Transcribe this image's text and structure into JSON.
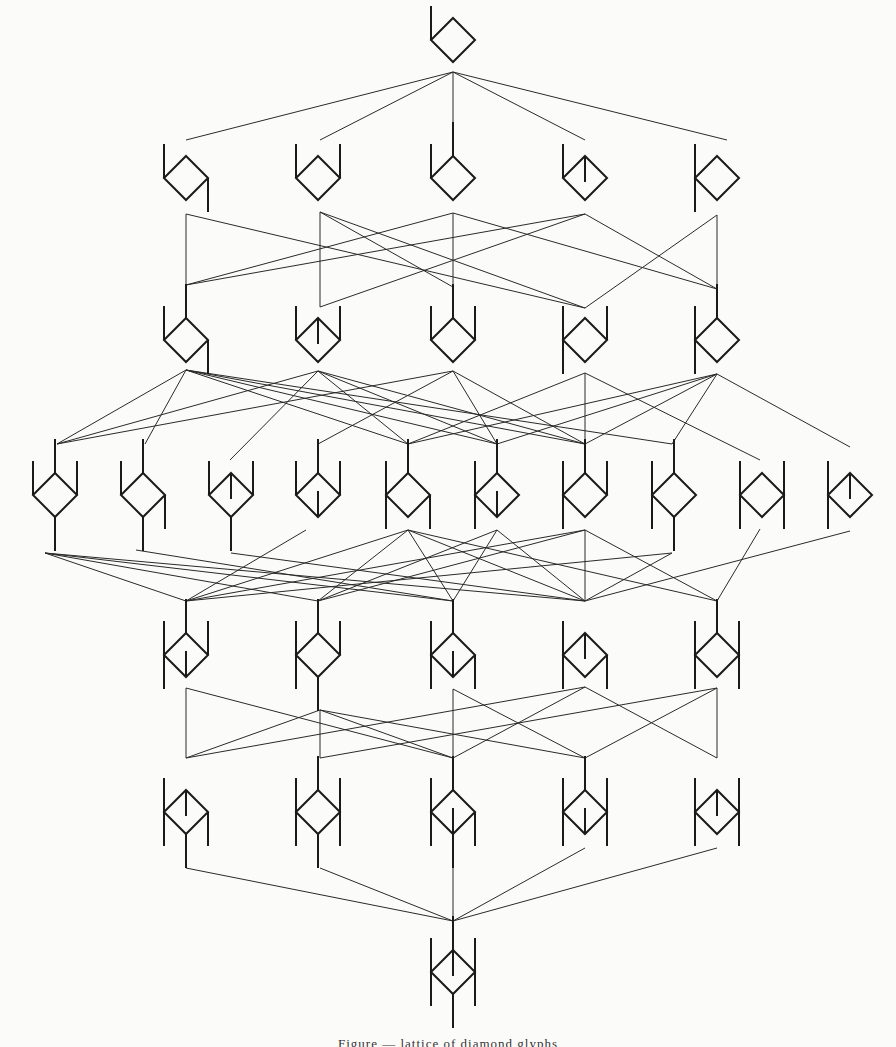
{
  "diagram": {
    "title": "Lattice of diamond glyphs",
    "colors": {
      "ink": "#1a1a1a",
      "edge": "#2a2a2a",
      "paper": "#fbfbfa"
    },
    "glyph_size": 22,
    "stub_len": 34,
    "stub_legend": {
      "LU": "left vertex stub going up",
      "LD": "left vertex stub going down",
      "RU": "right vertex stub going up",
      "RD": "right vertex stub going down",
      "TU": "top vertex stub going up",
      "BD": "bottom vertex stub going down",
      "IN": "inner stub from top vertex going down into diamond",
      "IB": "inner stub from bottom vertex going up into diamond"
    },
    "rows": [
      {
        "y": 40,
        "nodes": [
          {
            "id": "n0",
            "x": 453,
            "stubs": [
              "LU"
            ]
          }
        ]
      },
      {
        "y": 178,
        "nodes": [
          {
            "id": "r1a",
            "x": 186,
            "stubs": [
              "LU",
              "RD"
            ]
          },
          {
            "id": "r1b",
            "x": 318,
            "stubs": [
              "LU",
              "RU"
            ]
          },
          {
            "id": "r1c",
            "x": 453,
            "stubs": [
              "LU",
              "TU"
            ]
          },
          {
            "id": "r1d",
            "x": 585,
            "stubs": [
              "LU",
              "IN"
            ]
          },
          {
            "id": "r1e",
            "x": 717,
            "stubs": [
              "LU",
              "LD"
            ]
          }
        ]
      },
      {
        "y": 340,
        "nodes": [
          {
            "id": "r2a",
            "x": 186,
            "stubs": [
              "LU",
              "TU",
              "RD"
            ]
          },
          {
            "id": "r2b",
            "x": 318,
            "stubs": [
              "LU",
              "IN",
              "RU"
            ]
          },
          {
            "id": "r2c",
            "x": 453,
            "stubs": [
              "LU",
              "TU",
              "RU"
            ]
          },
          {
            "id": "r2d",
            "x": 585,
            "stubs": [
              "LU",
              "LD",
              "RU"
            ]
          },
          {
            "id": "r2e",
            "x": 717,
            "stubs": [
              "LU",
              "LD",
              "TU"
            ]
          }
        ]
      },
      {
        "y": 495,
        "nodes": [
          {
            "id": "r3a",
            "x": 55,
            "stubs": [
              "LU",
              "TU",
              "RU",
              "BD"
            ]
          },
          {
            "id": "r3b",
            "x": 143,
            "stubs": [
              "LU",
              "TU",
              "RD",
              "BD"
            ]
          },
          {
            "id": "r3c",
            "x": 231,
            "stubs": [
              "LU",
              "IN",
              "RU",
              "BD"
            ]
          },
          {
            "id": "r3d",
            "x": 318,
            "stubs": [
              "LU",
              "TU",
              "RU",
              "IB"
            ]
          },
          {
            "id": "r3e",
            "x": 408,
            "stubs": [
              "LU",
              "LD",
              "TU",
              "RD"
            ]
          },
          {
            "id": "r3f",
            "x": 497,
            "stubs": [
              "LU",
              "LD",
              "TU",
              "IB"
            ]
          },
          {
            "id": "r3g",
            "x": 585,
            "stubs": [
              "LU",
              "LD",
              "TU",
              "RU"
            ]
          },
          {
            "id": "r3h",
            "x": 674,
            "stubs": [
              "LU",
              "LD",
              "TU",
              "BD"
            ]
          },
          {
            "id": "r3i",
            "x": 762,
            "stubs": [
              "LU",
              "LD",
              "RU",
              "RD"
            ]
          },
          {
            "id": "r3j",
            "x": 850,
            "stubs": [
              "LU",
              "LD",
              "IN"
            ]
          }
        ]
      },
      {
        "y": 655,
        "nodes": [
          {
            "id": "r4a",
            "x": 186,
            "stubs": [
              "LU",
              "LD",
              "TU",
              "RU",
              "IB"
            ]
          },
          {
            "id": "r4b",
            "x": 318,
            "stubs": [
              "LU",
              "LD",
              "TU",
              "RU",
              "BD"
            ]
          },
          {
            "id": "r4c",
            "x": 453,
            "stubs": [
              "LU",
              "LD",
              "TU",
              "RD",
              "IB"
            ]
          },
          {
            "id": "r4d",
            "x": 585,
            "stubs": [
              "LU",
              "LD",
              "IN",
              "RD"
            ]
          },
          {
            "id": "r4e",
            "x": 717,
            "stubs": [
              "LU",
              "LD",
              "TU",
              "RU",
              "RD"
            ]
          }
        ]
      },
      {
        "y": 812,
        "nodes": [
          {
            "id": "r5a",
            "x": 186,
            "stubs": [
              "LU",
              "LD",
              "IN",
              "RD",
              "BD"
            ]
          },
          {
            "id": "r5b",
            "x": 318,
            "stubs": [
              "LU",
              "LD",
              "TU",
              "RU",
              "RD",
              "BD"
            ]
          },
          {
            "id": "r5c",
            "x": 453,
            "stubs": [
              "LU",
              "LD",
              "TU",
              "RD",
              "IB",
              "BD"
            ]
          },
          {
            "id": "r5d",
            "x": 585,
            "stubs": [
              "LU",
              "LD",
              "TU",
              "RU",
              "RD",
              "IB"
            ]
          },
          {
            "id": "r5e",
            "x": 717,
            "stubs": [
              "LU",
              "LD",
              "IN",
              "RU",
              "RD"
            ]
          }
        ]
      },
      {
        "y": 972,
        "nodes": [
          {
            "id": "n6",
            "x": 453,
            "stubs": [
              "LU",
              "LD",
              "TU",
              "RU",
              "RD",
              "IN",
              "BD"
            ]
          }
        ]
      }
    ],
    "edges": [
      {
        "from": [
          453,
          72
        ],
        "to": [
          186,
          140
        ]
      },
      {
        "from": [
          453,
          72
        ],
        "to": [
          320,
          140
        ]
      },
      {
        "from": [
          453,
          72
        ],
        "to": [
          453,
          140
        ]
      },
      {
        "from": [
          453,
          72
        ],
        "to": [
          585,
          140
        ]
      },
      {
        "from": [
          453,
          72
        ],
        "to": [
          727,
          140
        ]
      },
      {
        "from": [
          186,
          214
        ],
        "to": [
          186,
          285
        ]
      },
      {
        "from": [
          186,
          214
        ],
        "to": [
          585,
          308
        ]
      },
      {
        "from": [
          320,
          212
        ],
        "to": [
          320,
          307
        ]
      },
      {
        "from": [
          320,
          212
        ],
        "to": [
          453,
          287
        ]
      },
      {
        "from": [
          320,
          212
        ],
        "to": [
          585,
          308
        ]
      },
      {
        "from": [
          453,
          213
        ],
        "to": [
          186,
          285
        ]
      },
      {
        "from": [
          453,
          213
        ],
        "to": [
          453,
          287
        ]
      },
      {
        "from": [
          453,
          213
        ],
        "to": [
          717,
          289
        ]
      },
      {
        "from": [
          585,
          214
        ],
        "to": [
          186,
          285
        ]
      },
      {
        "from": [
          585,
          214
        ],
        "to": [
          320,
          307
        ]
      },
      {
        "from": [
          585,
          214
        ],
        "to": [
          717,
          289
        ]
      },
      {
        "from": [
          717,
          215
        ],
        "to": [
          585,
          308
        ]
      },
      {
        "from": [
          717,
          215
        ],
        "to": [
          717,
          289
        ]
      },
      {
        "from": [
          186,
          370
        ],
        "to": [
          57,
          444
        ]
      },
      {
        "from": [
          186,
          370
        ],
        "to": [
          145,
          444
        ]
      },
      {
        "from": [
          186,
          370
        ],
        "to": [
          408,
          444
        ]
      },
      {
        "from": [
          186,
          370
        ],
        "to": [
          585,
          444
        ]
      },
      {
        "from": [
          186,
          370
        ],
        "to": [
          497,
          444
        ]
      },
      {
        "from": [
          186,
          370
        ],
        "to": [
          672,
          444
        ]
      },
      {
        "from": [
          318,
          371
        ],
        "to": [
          57,
          444
        ]
      },
      {
        "from": [
          318,
          371
        ],
        "to": [
          230,
          460
        ]
      },
      {
        "from": [
          318,
          371
        ],
        "to": [
          408,
          444
        ]
      },
      {
        "from": [
          318,
          371
        ],
        "to": [
          497,
          444
        ]
      },
      {
        "from": [
          318,
          371
        ],
        "to": [
          585,
          444
        ]
      },
      {
        "from": [
          453,
          371
        ],
        "to": [
          57,
          444
        ]
      },
      {
        "from": [
          453,
          371
        ],
        "to": [
          318,
          444
        ]
      },
      {
        "from": [
          453,
          371
        ],
        "to": [
          497,
          444
        ]
      },
      {
        "from": [
          453,
          371
        ],
        "to": [
          585,
          444
        ]
      },
      {
        "from": [
          585,
          373
        ],
        "to": [
          408,
          444
        ]
      },
      {
        "from": [
          585,
          373
        ],
        "to": [
          585,
          444
        ]
      },
      {
        "from": [
          585,
          373
        ],
        "to": [
          760,
          460
        ]
      },
      {
        "from": [
          717,
          374
        ],
        "to": [
          408,
          444
        ]
      },
      {
        "from": [
          717,
          374
        ],
        "to": [
          497,
          444
        ]
      },
      {
        "from": [
          717,
          374
        ],
        "to": [
          585,
          444
        ]
      },
      {
        "from": [
          717,
          374
        ],
        "to": [
          672,
          444
        ]
      },
      {
        "from": [
          717,
          374
        ],
        "to": [
          850,
          447
        ]
      },
      {
        "from": [
          45,
          553
        ],
        "to": [
          186,
          601
        ]
      },
      {
        "from": [
          45,
          553
        ],
        "to": [
          318,
          601
        ]
      },
      {
        "from": [
          45,
          553
        ],
        "to": [
          453,
          601
        ]
      },
      {
        "from": [
          45,
          553
        ],
        "to": [
          585,
          601
        ]
      },
      {
        "from": [
          136,
          550
        ],
        "to": [
          453,
          601
        ]
      },
      {
        "from": [
          231,
          553
        ],
        "to": [
          585,
          601
        ]
      },
      {
        "from": [
          306,
          530
        ],
        "to": [
          186,
          601
        ]
      },
      {
        "from": [
          408,
          530
        ],
        "to": [
          186,
          601
        ]
      },
      {
        "from": [
          408,
          530
        ],
        "to": [
          318,
          601
        ]
      },
      {
        "from": [
          408,
          530
        ],
        "to": [
          453,
          601
        ]
      },
      {
        "from": [
          408,
          530
        ],
        "to": [
          585,
          601
        ]
      },
      {
        "from": [
          408,
          530
        ],
        "to": [
          717,
          601
        ]
      },
      {
        "from": [
          497,
          530
        ],
        "to": [
          318,
          601
        ]
      },
      {
        "from": [
          497,
          530
        ],
        "to": [
          453,
          601
        ]
      },
      {
        "from": [
          497,
          530
        ],
        "to": [
          585,
          601
        ]
      },
      {
        "from": [
          585,
          530
        ],
        "to": [
          186,
          601
        ]
      },
      {
        "from": [
          585,
          530
        ],
        "to": [
          318,
          601
        ]
      },
      {
        "from": [
          585,
          530
        ],
        "to": [
          585,
          601
        ]
      },
      {
        "from": [
          585,
          530
        ],
        "to": [
          717,
          601
        ]
      },
      {
        "from": [
          672,
          553
        ],
        "to": [
          186,
          601
        ]
      },
      {
        "from": [
          672,
          553
        ],
        "to": [
          585,
          601
        ]
      },
      {
        "from": [
          760,
          529
        ],
        "to": [
          717,
          601
        ]
      },
      {
        "from": [
          850,
          531
        ],
        "to": [
          585,
          601
        ]
      },
      {
        "from": [
          186,
          688
        ],
        "to": [
          186,
          758
        ]
      },
      {
        "from": [
          186,
          688
        ],
        "to": [
          453,
          758
        ]
      },
      {
        "from": [
          320,
          710
        ],
        "to": [
          186,
          758
        ]
      },
      {
        "from": [
          320,
          710
        ],
        "to": [
          453,
          758
        ]
      },
      {
        "from": [
          320,
          710
        ],
        "to": [
          585,
          758
        ]
      },
      {
        "from": [
          320,
          710
        ],
        "to": [
          320,
          758
        ]
      },
      {
        "from": [
          453,
          689
        ],
        "to": [
          453,
          758
        ]
      },
      {
        "from": [
          453,
          689
        ],
        "to": [
          585,
          758
        ]
      },
      {
        "from": [
          585,
          687
        ],
        "to": [
          186,
          758
        ]
      },
      {
        "from": [
          585,
          687
        ],
        "to": [
          453,
          758
        ]
      },
      {
        "from": [
          585,
          687
        ],
        "to": [
          717,
          758
        ]
      },
      {
        "from": [
          717,
          688
        ],
        "to": [
          320,
          758
        ]
      },
      {
        "from": [
          717,
          688
        ],
        "to": [
          585,
          758
        ]
      },
      {
        "from": [
          717,
          688
        ],
        "to": [
          717,
          758
        ]
      },
      {
        "from": [
          186,
          868
        ],
        "to": [
          453,
          921
        ]
      },
      {
        "from": [
          320,
          868
        ],
        "to": [
          453,
          921
        ]
      },
      {
        "from": [
          453,
          865
        ],
        "to": [
          453,
          921
        ]
      },
      {
        "from": [
          585,
          848
        ],
        "to": [
          453,
          921
        ]
      },
      {
        "from": [
          717,
          848
        ],
        "to": [
          453,
          921
        ]
      }
    ],
    "caption": "Figure — lattice of diamond glyphs"
  }
}
